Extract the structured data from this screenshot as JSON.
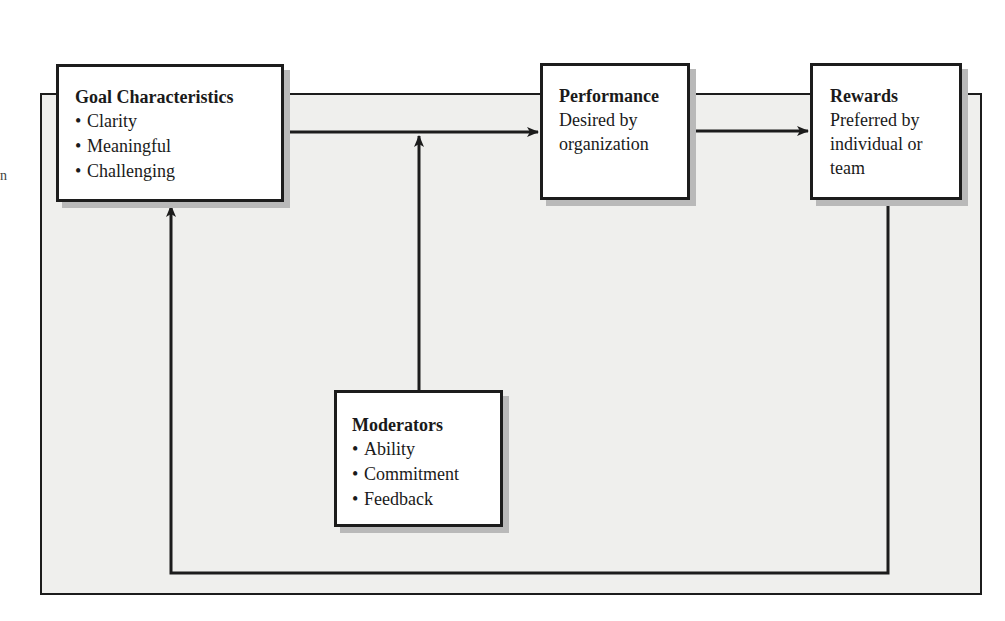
{
  "diagram": {
    "edge_fragment": "n",
    "goal": {
      "title": "Goal Characteristics",
      "items": [
        "Clarity",
        "Meaningful",
        "Challenging"
      ]
    },
    "performance": {
      "title": "Performance",
      "lines": [
        "Desired by",
        "organization"
      ]
    },
    "rewards": {
      "title": "Rewards",
      "lines": [
        "Preferred by",
        "individual or",
        "team"
      ]
    },
    "moderators": {
      "title": "Moderators",
      "items": [
        "Ability",
        "Commitment",
        "Feedback"
      ]
    },
    "bullet": "•",
    "connections": [
      {
        "from": "goal",
        "to": "performance",
        "type": "arrow"
      },
      {
        "from": "performance",
        "to": "rewards",
        "type": "arrow"
      },
      {
        "from": "moderators",
        "to": "goal-performance-link",
        "type": "arrow"
      },
      {
        "from": "rewards",
        "to": "goal",
        "type": "feedback-loop"
      }
    ],
    "colors": {
      "background_panel": "#efefed",
      "box_fill": "#ffffff",
      "stroke": "#1c1c1c",
      "shadow": "#b9b9b9"
    }
  }
}
